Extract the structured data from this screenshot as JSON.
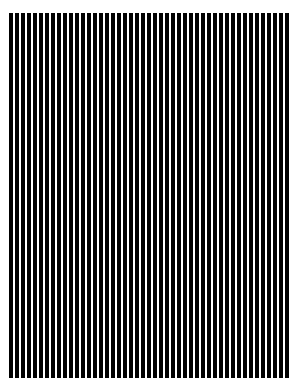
{
  "image": {
    "kind": "abstract-pattern",
    "title": "Vertical Stripe Grating",
    "width": 295,
    "height": 392,
    "background_color": "#ffffff"
  },
  "pattern": {
    "name": "vertical-square-wave-grating",
    "orientation": "vertical",
    "bar_color": "#000000",
    "gap_color": "#ffffff",
    "period_px": 6,
    "bar_width_px": 3.8,
    "gap_width_px": 2.2,
    "duty_cycle_percent": 63,
    "stripe_count": 47,
    "spatial_frequency_cycles_per_px": 0.1667
  },
  "field": {
    "left_px": 9,
    "top_px": 13,
    "right_px": 291,
    "bottom_px": 378,
    "width_px": 282,
    "height_px": 365
  },
  "margins": {
    "top_px": 13,
    "right_px": 4,
    "bottom_px": 14,
    "left_px": 9
  }
}
